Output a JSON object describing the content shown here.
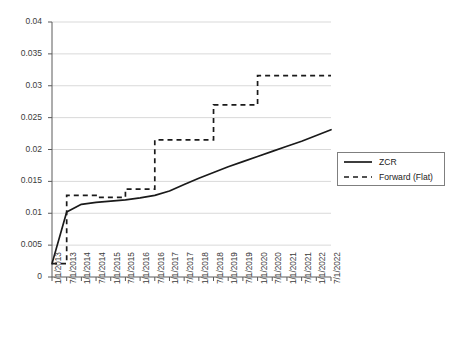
{
  "chart_data": {
    "type": "line",
    "title": "",
    "xlabel": "",
    "ylabel": "",
    "ylim": [
      0,
      0.04
    ],
    "ytick_values": [
      0,
      0.005,
      0.01,
      0.015,
      0.02,
      0.025,
      0.03,
      0.035,
      0.04
    ],
    "ytick_labels": [
      "0",
      "0.005",
      "0.01",
      "0.015",
      "0.02",
      "0.025",
      "0.03",
      "0.035",
      "0.04"
    ],
    "grid": true,
    "legend_position": "right",
    "categories": [
      "1/1/2013",
      "7/1/2013",
      "1/1/2014",
      "7/1/2014",
      "1/1/2015",
      "7/1/2015",
      "1/1/2016",
      "7/1/2016",
      "1/1/2017",
      "7/1/2017",
      "1/1/2018",
      "7/1/2018",
      "1/1/2019",
      "7/1/2019",
      "1/1/2020",
      "7/1/2020",
      "1/1/2021",
      "7/1/2021",
      "1/1/2022",
      "7/1/2022"
    ],
    "series": [
      {
        "name": "ZCR",
        "style": "solid",
        "color": "#1a1a1a",
        "values": [
          0.0021,
          0.0102,
          0.0114,
          0.0117,
          0.0119,
          0.0121,
          0.0124,
          0.0128,
          0.0135,
          0.0145,
          0.0155,
          0.0164,
          0.0173,
          0.0181,
          0.0189,
          0.0197,
          0.0205,
          0.0213,
          0.0222,
          0.0231
        ]
      },
      {
        "name": "Forward (Flat)",
        "style": "dashed",
        "color": "#1a1a1a",
        "values": [
          0.0021,
          0.0128,
          0.0128,
          0.0125,
          0.0125,
          0.0138,
          0.0138,
          0.0215,
          0.0215,
          0.0215,
          0.0215,
          0.027,
          0.027,
          0.027,
          0.0316,
          0.0316,
          0.0316,
          0.0316,
          0.0316,
          0.0316
        ]
      }
    ]
  },
  "legend": {
    "items": [
      {
        "label": "ZCR"
      },
      {
        "label": "Forward (Flat)"
      }
    ]
  }
}
